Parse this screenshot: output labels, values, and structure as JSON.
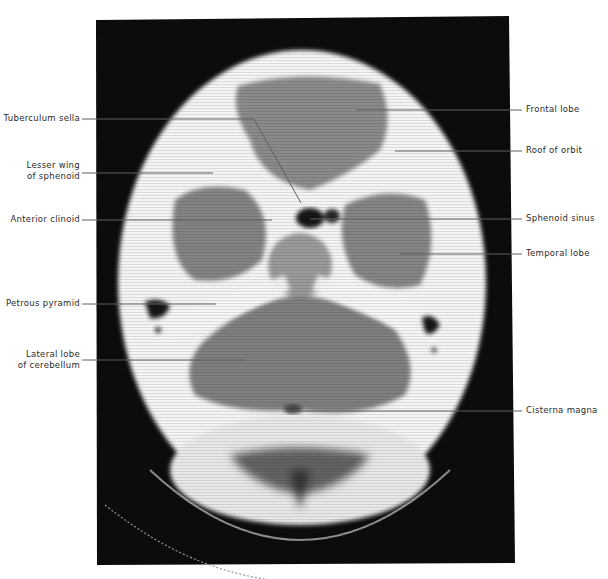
{
  "figure": {
    "type": "axial CT scan of head with anatomical labels",
    "panel_color": "#0b0b0b",
    "leader_color": "#6e6e6e"
  },
  "labels": {
    "left": [
      {
        "text": "Tuberculum sella",
        "lines": [
          "Tuberculum sella"
        ],
        "y": 119,
        "end_x": 254,
        "bend_to": [
          301,
          203
        ]
      },
      {
        "text": "Lesser wing of sphenoid",
        "lines": [
          "Lesser wing",
          "of sphenoid"
        ],
        "y": 173,
        "end_x": 213
      },
      {
        "text": "Anterior clinoid",
        "lines": [
          "Anterior clinoid"
        ],
        "y": 220,
        "end_x": 272
      },
      {
        "text": "Petrous pyramid",
        "lines": [
          "Petrous pyramid"
        ],
        "y": 304,
        "end_x": 216
      },
      {
        "text": "Lateral lobe of cerebellum",
        "lines": [
          "Lateral lobe",
          "of cerebellum"
        ],
        "y": 360,
        "end_x": 245
      }
    ],
    "right": [
      {
        "text": "Frontal lobe",
        "y": 110,
        "start_x": 357
      },
      {
        "text": "Roof of orbit",
        "y": 151,
        "start_x": 395
      },
      {
        "text": "Sphenoid sinus",
        "y": 219,
        "start_x": 310
      },
      {
        "text": "Temporal lobe",
        "y": 254,
        "start_x": 400
      },
      {
        "text": "Cisterna magna",
        "y": 411,
        "start_x": 295
      }
    ]
  }
}
